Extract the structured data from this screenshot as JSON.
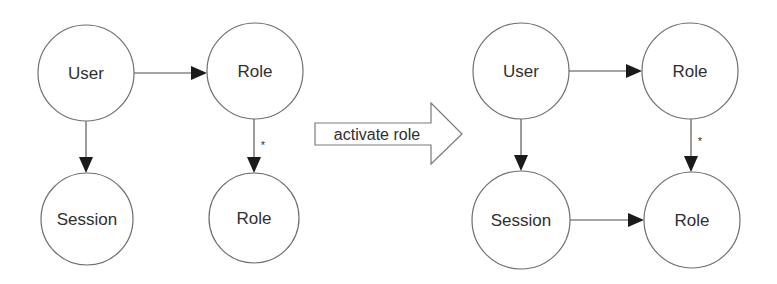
{
  "diagram": {
    "width": 777,
    "height": 284,
    "colors": {
      "background": "#ffffff",
      "node_stroke": "#6e6e6e",
      "edge_line": "#4a4a4a",
      "arrowhead": "#1a1a1a",
      "text": "#2f2f2f"
    },
    "before": {
      "nodes": [
        {
          "id": "user",
          "label": "User",
          "cx": 86,
          "cy": 73,
          "r": 48
        },
        {
          "id": "role_top",
          "label": "Role",
          "cx": 255,
          "cy": 71,
          "r": 48
        },
        {
          "id": "session",
          "label": "Session",
          "cx": 87,
          "cy": 219,
          "r": 46
        },
        {
          "id": "role_bottom",
          "label": "Role",
          "cx": 254,
          "cy": 218,
          "r": 45
        }
      ],
      "edges": [
        {
          "from": "user",
          "to": "role_top",
          "x1": 134,
          "y1": 73,
          "x2": 207,
          "y2": 73,
          "label": ""
        },
        {
          "from": "user",
          "to": "session",
          "x1": 86,
          "y1": 121,
          "x2": 86,
          "y2": 173,
          "label": ""
        },
        {
          "from": "role_top",
          "to": "role_bottom",
          "x1": 254,
          "y1": 119,
          "x2": 254,
          "y2": 173,
          "label": "*",
          "label_x": 263,
          "label_y": 145
        }
      ]
    },
    "transition": {
      "label": "activate role",
      "shaft_x": 315,
      "shaft_top": 123,
      "shaft_bottom": 145,
      "head_x": 431,
      "head_top": 103,
      "head_bottom": 164,
      "tip_x": 462,
      "tip_y": 134
    },
    "after": {
      "nodes": [
        {
          "id": "user",
          "label": "User",
          "cx": 521,
          "cy": 71,
          "r": 48
        },
        {
          "id": "role_top",
          "label": "Role",
          "cx": 690,
          "cy": 71,
          "r": 48
        },
        {
          "id": "session",
          "label": "Session",
          "cx": 521,
          "cy": 220,
          "r": 49
        },
        {
          "id": "role_bottom",
          "label": "Role",
          "cx": 692,
          "cy": 220,
          "r": 48
        }
      ],
      "edges": [
        {
          "from": "user",
          "to": "role_top",
          "x1": 569,
          "y1": 71,
          "x2": 642,
          "y2": 71,
          "label": ""
        },
        {
          "from": "user",
          "to": "session",
          "x1": 521,
          "y1": 119,
          "x2": 521,
          "y2": 171,
          "label": ""
        },
        {
          "from": "role_top",
          "to": "role_bottom",
          "x1": 691,
          "y1": 119,
          "x2": 691,
          "y2": 172,
          "label": "*",
          "label_x": 700,
          "label_y": 141
        },
        {
          "from": "session",
          "to": "role_bottom",
          "x1": 570,
          "y1": 220,
          "x2": 644,
          "y2": 220,
          "label": ""
        }
      ]
    }
  }
}
